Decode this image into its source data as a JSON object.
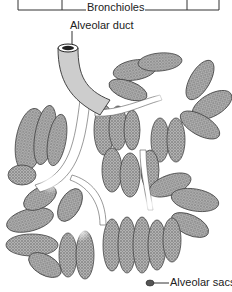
{
  "figure": {
    "type": "anatomical illustration",
    "style": "black-and-white stippled line drawing"
  },
  "labels": {
    "bronchioles": "Bronchioles",
    "alveolar_duct": "Alveolar duct",
    "alveolar_sacs": "Alveolar sacs"
  },
  "colors": {
    "ink": "#222222",
    "stipple_dark": "#6a6a6a",
    "stipple_mid": "#9a9a9a",
    "background": "#ffffff"
  }
}
